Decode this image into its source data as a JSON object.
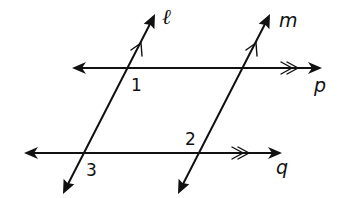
{
  "diagram": {
    "title": "",
    "colors": {
      "stroke": "#111111",
      "background": "#ffffff"
    },
    "lines": [
      {
        "id": "l",
        "label": "ℓ",
        "kind": "transversal",
        "parallel_marker": "single",
        "parallel_to": "m"
      },
      {
        "id": "m",
        "label": "m",
        "kind": "transversal",
        "parallel_marker": "single",
        "parallel_to": "l"
      },
      {
        "id": "p",
        "label": "p",
        "kind": "horizontal",
        "parallel_marker": "double",
        "parallel_to": "q"
      },
      {
        "id": "q",
        "label": "q",
        "kind": "horizontal",
        "parallel_marker": "double",
        "parallel_to": "p"
      }
    ],
    "angles": [
      {
        "label": "1",
        "at": "intersection of ℓ and p",
        "position": "below-right"
      },
      {
        "label": "2",
        "at": "intersection of m and q",
        "position": "above-left"
      },
      {
        "label": "3",
        "at": "intersection of ℓ and q",
        "position": "below-right"
      }
    ]
  }
}
